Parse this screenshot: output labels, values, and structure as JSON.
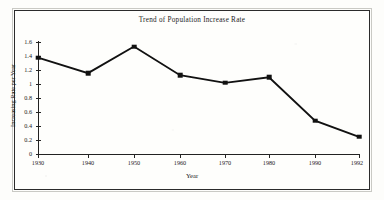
{
  "chart_data": {
    "type": "line",
    "title": "Trend of Population Increase Rate",
    "xlabel": "Year",
    "ylabel": "Increasing Rate per Year",
    "categories": [
      "1930",
      "1940",
      "1950",
      "1960",
      "1970",
      "1980",
      "1990",
      "1992"
    ],
    "x": [
      1930,
      1940,
      1950,
      1960,
      1970,
      1980,
      1990,
      1992
    ],
    "values": [
      1.37,
      1.15,
      1.53,
      1.12,
      1.01,
      1.09,
      0.47,
      0.24
    ],
    "series": [
      {
        "name": "Increasing Rate per Year",
        "values": [
          1.37,
          1.15,
          1.53,
          1.12,
          1.01,
          1.09,
          0.47,
          0.24
        ]
      }
    ],
    "ylim": [
      0,
      1.6
    ],
    "yticks": [
      "0",
      "0.2",
      "0.4",
      "0.6",
      "0.8",
      "1",
      "1.2",
      "1.4",
      "1.6"
    ],
    "ytick_values": [
      0,
      0.2,
      0.4,
      0.6,
      0.8,
      1.0,
      1.2,
      1.4,
      1.6
    ],
    "xticks": [
      "1930",
      "1940",
      "1950",
      "1960",
      "1970",
      "1980",
      "1990",
      "1992"
    ],
    "grid": false,
    "legend": false,
    "legend_position": "none",
    "marker": "square",
    "line_color": "#111111",
    "marker_color": "#111111",
    "background_color": "#fefefc",
    "frame_color": "#2b2b2b"
  },
  "figure": {
    "border_present": true
  }
}
